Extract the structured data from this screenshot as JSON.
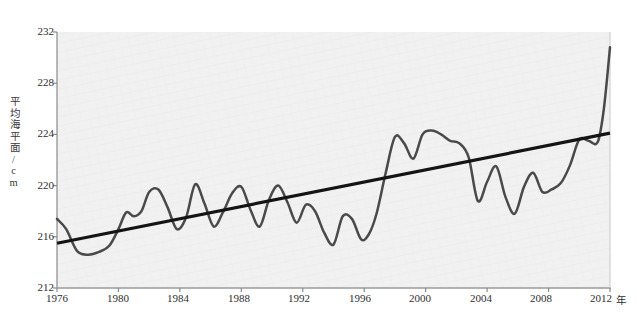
{
  "chart_data": {
    "type": "line",
    "title": "",
    "subtitle": "",
    "xlabel": "年",
    "ylabel": "平均海平面/cm",
    "xlim": [
      1976,
      2012
    ],
    "ylim": [
      212,
      232
    ],
    "xticks": [
      1976,
      1980,
      1984,
      1988,
      1992,
      1996,
      2000,
      2004,
      2008,
      2012
    ],
    "yticks": [
      212,
      216,
      220,
      224,
      228,
      232
    ],
    "grid": false,
    "legend": "none",
    "plot_background": "#f0f0f0",
    "series": [
      {
        "name": "平均海平面",
        "color": "#4a4a4a",
        "type": "line",
        "x": [
          1976,
          1976.6,
          1977.3,
          1978.0,
          1978.7,
          1979.4,
          1980.0,
          1980.5,
          1981.0,
          1981.5,
          1982.0,
          1982.6,
          1983.2,
          1983.8,
          1984.4,
          1985.0,
          1985.6,
          1986.2,
          1986.8,
          1987.4,
          1988.0,
          1988.6,
          1989.2,
          1989.8,
          1990.4,
          1991.0,
          1991.6,
          1992.2,
          1992.8,
          1993.4,
          1994.0,
          1994.6,
          1995.2,
          1995.8,
          1996.3,
          1996.8,
          1997.4,
          1998.0,
          1998.6,
          1999.2,
          1999.8,
          2000.4,
          2001.0,
          2001.6,
          2002.2,
          2002.8,
          2003.4,
          2004.0,
          2004.6,
          2005.2,
          2005.8,
          2006.4,
          2007.0,
          2007.6,
          2008.2,
          2008.8,
          2009.4,
          2010.0,
          2010.6,
          2011.2,
          2011.6,
          2012.0
        ],
        "y": [
          217.4,
          216.6,
          214.9,
          214.6,
          214.8,
          215.3,
          216.6,
          217.9,
          217.6,
          218.0,
          219.5,
          219.7,
          218.3,
          216.6,
          217.5,
          220.1,
          218.6,
          216.8,
          217.9,
          219.4,
          219.9,
          218.1,
          216.8,
          218.9,
          220.0,
          218.7,
          217.1,
          218.5,
          218.0,
          216.3,
          215.4,
          217.6,
          217.4,
          215.8,
          216.2,
          217.8,
          221.0,
          223.8,
          223.3,
          222.1,
          224.0,
          224.3,
          224.0,
          223.5,
          223.3,
          222.2,
          218.8,
          220.3,
          221.5,
          219.1,
          217.8,
          219.9,
          221.0,
          219.5,
          219.7,
          220.2,
          221.6,
          223.6,
          223.5,
          223.4,
          226.0,
          230.8
        ]
      },
      {
        "name": "趋势线",
        "color": "#141414",
        "type": "trendline",
        "x": [
          1976,
          2012
        ],
        "y": [
          215.5,
          224.1
        ]
      }
    ]
  },
  "axis": {
    "y_unit_label": "平均海平面/cm",
    "x_unit_label": "年"
  }
}
